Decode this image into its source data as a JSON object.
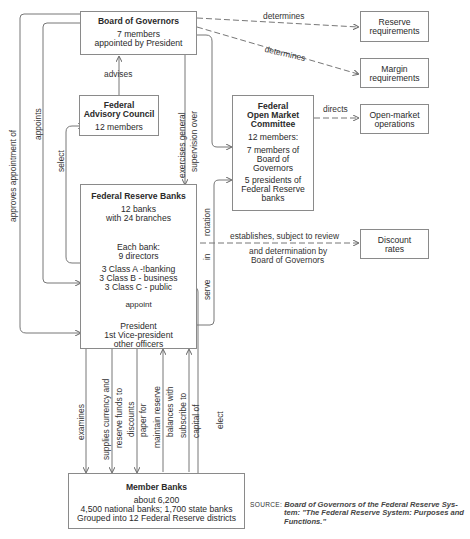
{
  "boxes": {
    "board": {
      "title": "Board of Governors",
      "lines": [
        "7 members",
        "appointed by President"
      ]
    },
    "advisory": {
      "title_lines": [
        "Federal",
        "Advisory Council"
      ],
      "lines": [
        "12 members"
      ]
    },
    "fomc": {
      "title_lines": [
        "Federal",
        "Open Market",
        "Committee"
      ],
      "lines": [
        "12 members:",
        "7 members of",
        "Board of",
        "Governors",
        "5 presidents of",
        "Federal Reserve",
        "banks"
      ]
    },
    "reserve_banks": {
      "title": "Federal Reserve Banks",
      "lines": [
        "12 banks",
        "with 24 branches"
      ],
      "directors": [
        "Each bank:",
        "9 directors"
      ],
      "classes": [
        "3 Class A -!banking",
        "3 Class B - business",
        "3 Class C - public"
      ],
      "appoint": "appoint",
      "officers": [
        "President",
        "1st Vice-president",
        "other officers"
      ]
    },
    "reserve_req": {
      "lines": [
        "Reserve",
        "requirements"
      ]
    },
    "margin_req": {
      "lines": [
        "Margin",
        "requirements"
      ]
    },
    "open_market": {
      "lines": [
        "Open-market",
        "operations"
      ]
    },
    "discount": {
      "lines": [
        "Discount",
        "rates"
      ]
    },
    "member_banks": {
      "title": "Member Banks",
      "lines": [
        "about 6,200",
        "4,500 national banks; 1,700 state banks",
        "Grouped into 12 Federal Reserve districts"
      ]
    }
  },
  "labels": {
    "determines_1": "determines",
    "determines_2": "determines",
    "directs": "directs",
    "advises": "advises",
    "exercises_1": "exercises general",
    "exercises_2": "supervision over",
    "approves": "approves appointment of",
    "appoints": "appoints",
    "select": "select",
    "rotation": "rotation",
    "in": "in",
    "serve": "serve",
    "establishes_1": "establishes, subject to review",
    "establishes_2": "and determination by",
    "establishes_3": "Board of Governors",
    "examines": "examines",
    "supplies_1": "supplies currency and",
    "supplies_2": "reserve funds to",
    "discounts_1": "discounts",
    "discounts_2": "paper for",
    "maintain_1": "maintain reserve",
    "maintain_2": "balances with",
    "subscribe_1": "subscribe to",
    "subscribe_2": "capital of",
    "elect": "elect"
  },
  "source": {
    "key": "SOURCE:",
    "lines": [
      "Board of Governors of the Federal Reserve Sys-",
      "tem: \"The Federal Reserve System: Purposes and",
      "Functions.\""
    ]
  }
}
